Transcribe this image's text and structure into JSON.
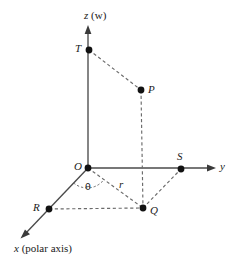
{
  "figure": {
    "background_color": "#ffffff",
    "line_color": "#6b6b6b",
    "axis_color": "#4a4a4a",
    "point_color": "#121212",
    "labels": {
      "z_axis": "z",
      "z_axis_note": "(w)",
      "y_axis": "y",
      "x_axis": "x",
      "x_axis_note": "(polar axis)",
      "point_T": "T",
      "point_P": "P",
      "point_O": "O",
      "point_S": "S",
      "point_R": "R",
      "point_Q": "Q",
      "angle_theta": "θ",
      "radius_r": "r"
    },
    "points": [
      {
        "name": "T",
        "label": "T",
        "x": 89,
        "y": 50
      },
      {
        "name": "P",
        "label": "P",
        "x": 141,
        "y": 90
      },
      {
        "name": "O",
        "label": "O",
        "x": 88,
        "y": 168
      },
      {
        "name": "S",
        "label": "S",
        "x": 181,
        "y": 169
      },
      {
        "name": "R",
        "label": "R",
        "x": 49,
        "y": 209
      },
      {
        "name": "Q",
        "label": "Q",
        "x": 143,
        "y": 208
      }
    ],
    "segments": [
      {
        "name": "z-axis",
        "style": "solid",
        "from": "O",
        "to": "z-tip"
      },
      {
        "name": "y-axis",
        "style": "solid",
        "from": "O",
        "to": "y-tip"
      },
      {
        "name": "x-axis",
        "style": "solid",
        "from": "O",
        "to": "x-tip"
      },
      {
        "name": "T-to-P",
        "style": "dashed"
      },
      {
        "name": "P-to-Q",
        "style": "dashed"
      },
      {
        "name": "O-to-Q",
        "style": "dashed"
      },
      {
        "name": "R-to-Q",
        "style": "dashed"
      },
      {
        "name": "Q-to-S",
        "style": "dashed"
      },
      {
        "name": "theta-arc",
        "style": "dashed-arc"
      }
    ]
  }
}
